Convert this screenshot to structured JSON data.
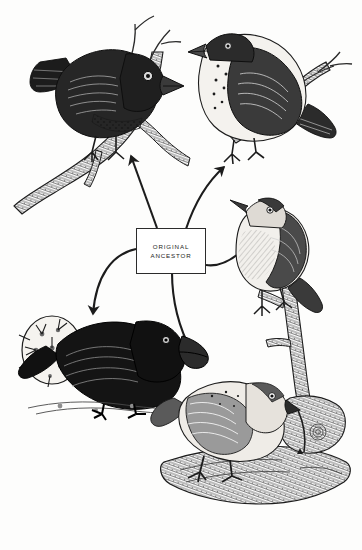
{
  "diagram": {
    "background_color": "#fdfdfc",
    "ink_color": "#1c1c1c",
    "center_label": {
      "line1": "ORIGINAL",
      "line2": "ANCESTOR"
    },
    "birds": [
      {
        "id": "top-left-finch",
        "name": "large-ground-finch-dark",
        "position": "top-left",
        "facing": "right",
        "plumage": "dark body with pale speckled belly",
        "beak": "heavy conical",
        "perch": "gnarled branch"
      },
      {
        "id": "top-right-finch",
        "name": "medium-ground-finch-pale",
        "position": "top-right",
        "facing": "left",
        "plumage": "pale breast with dark streaked wings",
        "beak": "stout conical",
        "perch": "twiggy branch"
      },
      {
        "id": "right-finch",
        "name": "warbler-finch",
        "position": "right",
        "facing": "left",
        "plumage": "pale buff breast, dark back",
        "beak": "slender pointed",
        "perch": "upright branch"
      },
      {
        "id": "bottom-left-finch",
        "name": "large-cactus-ground-finch",
        "position": "bottom-left",
        "facing": "right",
        "plumage": "solid black",
        "beak": "massive crushing",
        "perch": "ground beside cactus pad"
      },
      {
        "id": "bottom-center-finch",
        "name": "woodpecker-finch",
        "position": "bottom-center",
        "facing": "right",
        "plumage": "mottled brown and cream",
        "beak": "straight probing, holding cactus spine tool",
        "perch": "fallen log"
      }
    ],
    "arrows": [
      {
        "id": "arrow-to-top-left",
        "from": "ORIGINAL ANCESTOR",
        "to": "top-left-finch",
        "style": "straight"
      },
      {
        "id": "arrow-to-top-right",
        "from": "ORIGINAL ANCESTOR",
        "to": "top-right-finch",
        "style": "curved"
      },
      {
        "id": "arrow-to-right",
        "from": "ORIGINAL ANCESTOR",
        "to": "right-finch",
        "style": "curved"
      },
      {
        "id": "arrow-to-bottom-left",
        "from": "ORIGINAL ANCESTOR",
        "to": "bottom-left-finch",
        "style": "curved"
      },
      {
        "id": "arrow-to-bottom-center",
        "from": "ORIGINAL ANCESTOR",
        "to": "bottom-center-finch",
        "style": "curved"
      }
    ]
  }
}
